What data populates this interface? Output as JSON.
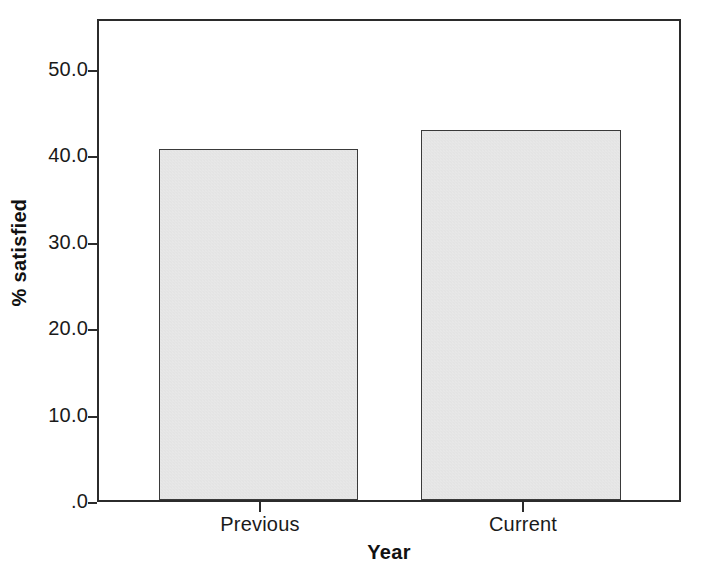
{
  "chart_data": {
    "type": "bar",
    "title": "",
    "subtitle": "",
    "xlabel": "Year",
    "ylabel": "% satisfied",
    "categories": [
      "Previous",
      "Current"
    ],
    "values": [
      41.0,
      43.2
    ],
    "series": [
      {
        "name": "% satisfied",
        "values": [
          41.0,
          43.2
        ]
      }
    ],
    "ylim": [
      0.0,
      55.9
    ],
    "yticks": [
      0.0,
      10.0,
      20.0,
      30.0,
      40.0,
      50.0
    ],
    "ytick_labels": [
      ".0",
      "10.0",
      "20.0",
      "30.0",
      "40.0",
      "50.0"
    ],
    "xtick_labels": [
      "Previous",
      "Current"
    ],
    "grid": false,
    "legend": false,
    "legend_position": "none",
    "bar_fill_color": "#e4e4e4",
    "bar_edge_color": "#3a3a3a",
    "axis_color": "#2b2b2b",
    "background_color": "#ffffff",
    "annotations": []
  },
  "figure": {
    "plot_area": {
      "left": 97,
      "top": 19,
      "width": 584,
      "height": 483
    }
  }
}
